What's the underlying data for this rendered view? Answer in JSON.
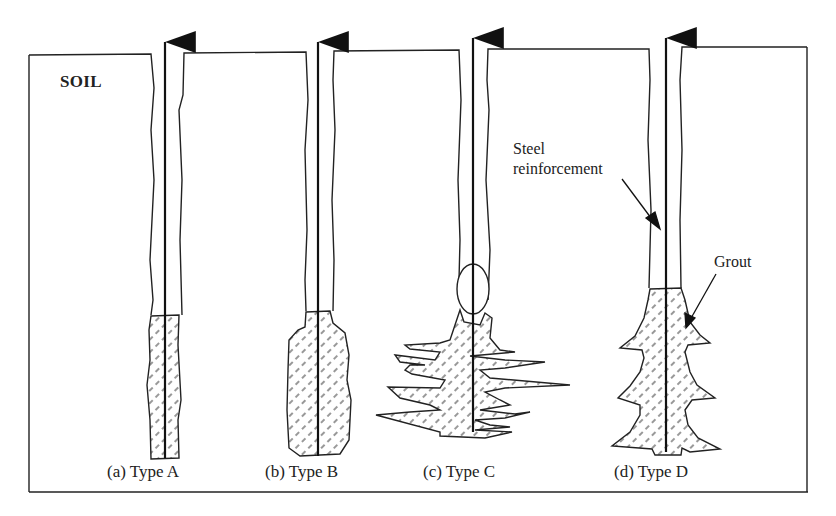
{
  "diagram": {
    "soil_label": "SOIL",
    "annotations": {
      "steel": [
        "Steel",
        "reinforcement"
      ],
      "grout": "Grout"
    },
    "captions": [
      {
        "id": "a",
        "text": "(a) Type A"
      },
      {
        "id": "b",
        "text": "(b) Type B"
      },
      {
        "id": "c",
        "text": "(c) Type C"
      },
      {
        "id": "d",
        "text": "(d) Type D"
      }
    ],
    "colors": {
      "line": "#222222",
      "background": "#ffffff",
      "hatch": "#444444"
    }
  }
}
